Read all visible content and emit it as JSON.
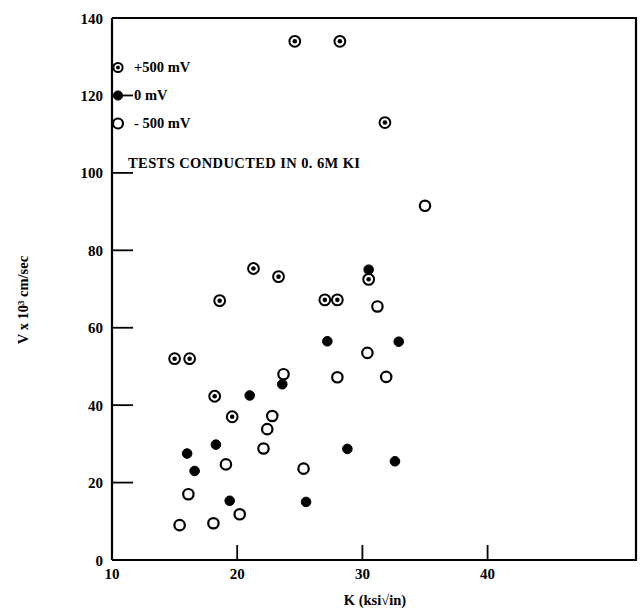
{
  "chart_data": {
    "type": "scatter",
    "title": "",
    "subtitle": "",
    "xlabel": "K (ksi√in)",
    "ylabel": "V x 10³ cm/sec",
    "xlim": [
      10,
      44
    ],
    "ylim": [
      0,
      140
    ],
    "xticks": [
      10,
      20,
      30,
      40
    ],
    "yticks": [
      0,
      20,
      40,
      60,
      80,
      100,
      120,
      140
    ],
    "xtick_labels": [
      "10",
      "20",
      "30",
      "40"
    ],
    "ytick_labels": [
      "0",
      "20",
      "40",
      "60",
      "80",
      "100",
      "120",
      "140"
    ],
    "grid": false,
    "legend_position": "upper-left-inside",
    "annotation": "TESTS CONDUCTED IN 0. 6M KI",
    "series": [
      {
        "name": "+500 mV",
        "marker": "circle-dot",
        "fill": "#ffffff",
        "stroke": "#000000",
        "points": [
          [
            15.0,
            52.0
          ],
          [
            16.2,
            52.0
          ],
          [
            18.2,
            42.3
          ],
          [
            18.6,
            67.0
          ],
          [
            21.3,
            75.3
          ],
          [
            23.3,
            73.2
          ],
          [
            24.6,
            134.0
          ],
          [
            27.0,
            67.2
          ],
          [
            28.0,
            67.2
          ],
          [
            28.2,
            134.0
          ],
          [
            30.5,
            72.5
          ],
          [
            31.8,
            113.0
          ],
          [
            19.6,
            37.0
          ]
        ]
      },
      {
        "name": "0 mV",
        "marker": "circle-filled",
        "fill": "#000000",
        "stroke": "#000000",
        "points": [
          [
            16.0,
            27.5
          ],
          [
            16.6,
            23.0
          ],
          [
            18.3,
            29.8
          ],
          [
            19.4,
            15.3
          ],
          [
            21.0,
            42.5
          ],
          [
            23.6,
            45.4
          ],
          [
            25.5,
            15.0
          ],
          [
            27.2,
            56.5
          ],
          [
            28.8,
            28.7
          ],
          [
            30.5,
            75.0
          ],
          [
            32.6,
            25.5
          ],
          [
            32.9,
            56.4
          ]
        ]
      },
      {
        "name": "- 500 mV",
        "marker": "circle-open",
        "fill": "#ffffff",
        "stroke": "#000000",
        "points": [
          [
            15.4,
            9.0
          ],
          [
            16.1,
            17.0
          ],
          [
            18.1,
            9.5
          ],
          [
            19.1,
            24.7
          ],
          [
            20.2,
            11.8
          ],
          [
            22.1,
            28.8
          ],
          [
            22.4,
            33.8
          ],
          [
            22.8,
            37.2
          ],
          [
            23.7,
            48.0
          ],
          [
            25.3,
            23.6
          ],
          [
            28.0,
            47.2
          ],
          [
            30.4,
            53.5
          ],
          [
            31.2,
            65.5
          ],
          [
            31.9,
            47.3
          ],
          [
            35.0,
            91.5
          ]
        ]
      }
    ]
  },
  "legend": {
    "items": [
      {
        "label": "+500 mV",
        "marker": "circle-dot"
      },
      {
        "label": "0 mV",
        "marker": "circle-filled"
      },
      {
        "label": "- 500 mV",
        "marker": "circle-open"
      }
    ]
  },
  "colors": {
    "axis": "#000000",
    "background": "#ffffff",
    "marker_stroke": "#000000",
    "marker_fill_dark": "#000000",
    "marker_fill_light": "#ffffff"
  }
}
